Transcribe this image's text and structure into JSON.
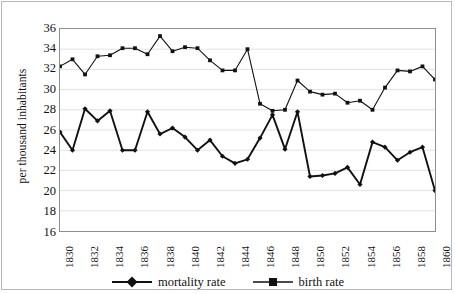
{
  "chart_data": {
    "type": "line",
    "title": "",
    "xlabel": "",
    "ylabel": "per thousand inhabitants",
    "ylim": [
      16,
      36
    ],
    "ytick_step": 2,
    "yticks": [
      36,
      34,
      32,
      30,
      28,
      26,
      24,
      22,
      20,
      18,
      16
    ],
    "xlim": [
      1830,
      1860
    ],
    "xtick_step": 2,
    "xticks": [
      "1830",
      "1832",
      "1834",
      "1836",
      "1838",
      "1840",
      "1842",
      "1844",
      "1846",
      "1848",
      "1850",
      "1852",
      "1854",
      "1856",
      "1858",
      "1860"
    ],
    "x": [
      1830,
      1831,
      1832,
      1833,
      1834,
      1835,
      1836,
      1837,
      1838,
      1839,
      1840,
      1841,
      1842,
      1843,
      1844,
      1845,
      1846,
      1847,
      1848,
      1849,
      1850,
      1851,
      1852,
      1853,
      1854,
      1855,
      1856,
      1857,
      1858,
      1859,
      1860
    ],
    "grid": true,
    "grid_axis": "y",
    "legend_position": "bottom",
    "series": [
      {
        "name": "mortality rate",
        "marker": "diamond",
        "color": "#111111",
        "values": [
          25.8,
          24.0,
          28.1,
          26.9,
          27.9,
          24.0,
          24.0,
          27.8,
          25.6,
          26.2,
          25.3,
          24.0,
          25.0,
          23.4,
          22.7,
          23.1,
          25.2,
          27.5,
          24.1,
          27.8,
          21.4,
          21.5,
          21.7,
          22.3,
          20.6,
          24.8,
          24.3,
          23.0,
          23.8,
          24.3,
          20.0
        ]
      },
      {
        "name": "birth rate",
        "marker": "square",
        "color": "#111111",
        "values": [
          32.3,
          33.0,
          31.5,
          33.3,
          33.4,
          34.1,
          34.1,
          33.5,
          35.3,
          33.8,
          34.2,
          34.1,
          32.9,
          31.9,
          31.9,
          34.0,
          28.6,
          27.9,
          28.0,
          30.9,
          29.8,
          29.5,
          29.6,
          28.7,
          28.9,
          28.0,
          30.2,
          31.9,
          31.8,
          32.3,
          31.0
        ]
      }
    ]
  },
  "legend": {
    "items": [
      {
        "label": "mortality rate",
        "marker": "diamond"
      },
      {
        "label": "birth rate",
        "marker": "square"
      }
    ]
  }
}
